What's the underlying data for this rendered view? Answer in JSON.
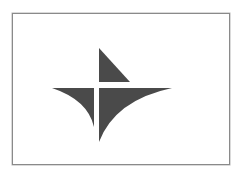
{
  "image": {
    "description": "Abstract four-part star/compass logo in a bordered frame",
    "colors": {
      "background": "#ffffff",
      "frame_border": "#8a8a8a",
      "logo_fill": "#4a4a4a"
    }
  },
  "logo": {
    "icon": "compass-star-logo",
    "parts": [
      "top-triangle",
      "left-wing",
      "right-wing"
    ]
  }
}
